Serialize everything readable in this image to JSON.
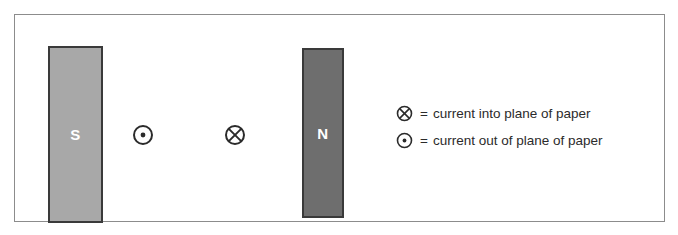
{
  "diagram": {
    "frame": {
      "border_color": "#8c8c8c"
    },
    "magnets": [
      {
        "pole": "S",
        "label": "S",
        "name": "south-pole-magnet",
        "fill": "#a8a8a8",
        "label_color": "#ffffff"
      },
      {
        "pole": "N",
        "label": "N",
        "name": "north-pole-magnet",
        "fill": "#6e6e6e",
        "label_color": "#ffffff"
      }
    ],
    "field_symbols": [
      {
        "name": "current-out-of-page-symbol",
        "glyph": "circle-dot",
        "meaning": "current out of plane of paper"
      },
      {
        "name": "current-into-page-symbol",
        "glyph": "circle-cross",
        "meaning": "current into plane of paper"
      }
    ]
  },
  "legend": {
    "rows": [
      {
        "symbol": "circle-cross",
        "equals": "=",
        "text": "current into plane of paper"
      },
      {
        "symbol": "circle-dot",
        "equals": "=",
        "text": "current out of plane of paper"
      }
    ]
  }
}
